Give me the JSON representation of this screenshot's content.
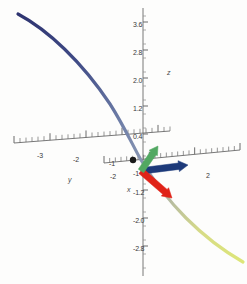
{
  "figure": {
    "kind": "3d-parametric-curve-with-frenet-frame",
    "background": "#fdfdfc"
  },
  "axes": {
    "z": {
      "label": "z",
      "label_pos": {
        "x": 167,
        "y": 69
      },
      "color": "#555555",
      "ticks": [
        {
          "text": "3.6",
          "x": 143,
          "y": 22,
          "tx": 133,
          "ty": 25
        },
        {
          "text": "2.8",
          "x": 143,
          "y": 50,
          "tx": 133,
          "ty": 53
        },
        {
          "text": "2.0",
          "x": 143,
          "y": 78,
          "tx": 133,
          "ty": 81
        },
        {
          "text": "1.2",
          "x": 143,
          "y": 106,
          "tx": 133,
          "ty": 109
        },
        {
          "text": "0.4",
          "x": 143,
          "y": 134,
          "tx": 133,
          "ty": 137
        },
        {
          "text": "-1.2",
          "x": 143,
          "y": 190,
          "tx": 133,
          "ty": 193
        },
        {
          "text": "-2.0",
          "x": 143,
          "y": 218,
          "tx": 133,
          "ty": 221
        },
        {
          "text": "-2.8",
          "x": 143,
          "y": 246,
          "tx": 133,
          "ty": 249
        }
      ],
      "minor_spacing_px": 14
    },
    "y": {
      "label": "y",
      "label_pos": {
        "x": 68,
        "y": 176
      },
      "color": "#555555",
      "ticks": [
        {
          "text": "-3",
          "x": 37,
          "y": 152
        },
        {
          "text": "-2",
          "x": 73,
          "y": 156
        },
        {
          "text": "-1",
          "x": 109,
          "y": 160
        }
      ]
    },
    "x": {
      "label": "x",
      "label_pos": {
        "x": 127,
        "y": 186
      },
      "color": "#555555",
      "ticks": [
        {
          "text": "-2",
          "x": 110,
          "y": 173
        },
        {
          "text": "-1",
          "x": 133,
          "y": 170
        },
        {
          "text": "2",
          "x": 206,
          "y": 172
        }
      ]
    }
  },
  "curve": {
    "name": "space-curve",
    "gradient_stops": [
      {
        "offset": "0%",
        "color": "#2e3470"
      },
      {
        "offset": "22%",
        "color": "#3f4a85"
      },
      {
        "offset": "45%",
        "color": "#6f7fa8"
      },
      {
        "offset": "60%",
        "color": "#8e9bb5"
      },
      {
        "offset": "72%",
        "color": "#b8bda0"
      },
      {
        "offset": "85%",
        "color": "#d7dc86"
      },
      {
        "offset": "100%",
        "color": "#dde678"
      }
    ],
    "width_px": 3.2,
    "path": "M 18,14 C 48,30 82,62 110,104 C 124,126 133,146 141,160 C 152,178 166,198 186,218 C 204,236 222,250 243,262"
  },
  "vectors": [
    {
      "name": "tangent-vector",
      "color": "#1d3a7a",
      "from": {
        "x": 141,
        "y": 171
      },
      "to": {
        "x": 188,
        "y": 165
      },
      "width": 6.5,
      "head_len": 11,
      "head_w": 11
    },
    {
      "name": "normal-vector",
      "color": "#e02318",
      "from": {
        "x": 141,
        "y": 171
      },
      "to": {
        "x": 172,
        "y": 198
      },
      "width": 6.5,
      "head_len": 11,
      "head_w": 11
    },
    {
      "name": "binormal-vector",
      "color": "#52a862",
      "from": {
        "x": 141,
        "y": 171
      },
      "to": {
        "x": 158,
        "y": 146
      },
      "width": 6.5,
      "head_len": 10,
      "head_w": 10
    }
  ],
  "point_marker": {
    "name": "curve-point",
    "color": "#1a1a1a",
    "x": 133,
    "y": 160,
    "r": 3.2
  },
  "chart_data": {
    "type": "line",
    "title": "",
    "xlabel": "x",
    "ylabel": "y",
    "zlabel": "z",
    "z_ticks": [
      3.6,
      2.8,
      2.0,
      1.2,
      0.4,
      -1.2,
      -2.0,
      -2.8
    ],
    "y_ticks": [
      -3,
      -2,
      -1
    ],
    "x_ticks": [
      -2,
      -1,
      2
    ],
    "series": [
      {
        "name": "space-curve",
        "description": "gradient-colored 3D parametric curve descending from upper-left to lower-right",
        "color_start": "#2e3470",
        "color_end": "#dde678"
      },
      {
        "name": "tangent-vector",
        "color": "#1d3a7a"
      },
      {
        "name": "normal-vector",
        "color": "#e02318"
      },
      {
        "name": "binormal-vector",
        "color": "#52a862"
      }
    ]
  }
}
